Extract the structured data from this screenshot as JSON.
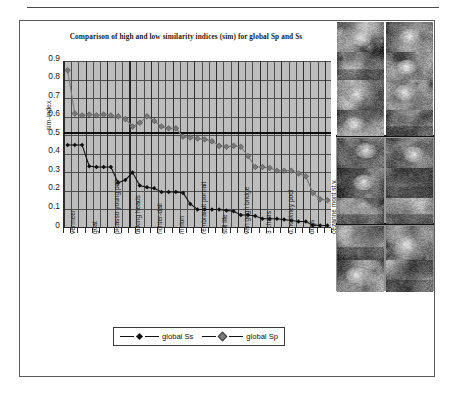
{
  "figure": {
    "title": "Comparison of high and low similarity indices (sim) for global Sp and Ss",
    "ylabel": "sim-index"
  },
  "legend": {
    "position": "bottom-center",
    "items": [
      {
        "label": "global Ss",
        "marker": "diamond",
        "color": "#111111"
      },
      {
        "label": "global Sp",
        "marker": "diamond",
        "color": "#7a7a7a"
      }
    ]
  },
  "colors": {
    "plot_background": "#bdbdbd",
    "gridline": "#4d4d4d",
    "axis": "#2b2b2b",
    "series_ss": "#111111",
    "series_sp": "#7a7a7a",
    "threshold_line": "#0d0d0d",
    "frame": "#5a5a5a"
  },
  "annotations": {
    "threshold_value": 0.515,
    "vertical_marker_category": "talking heads"
  },
  "thumbnails": {
    "columns": 2,
    "groups": [
      {
        "name": "group-portraits",
        "rows": [
          [
            {
              "name": "thumb-blonde-portrait"
            },
            {
              "name": "thumb-girl-pearl-earring"
            }
          ],
          [
            {
              "name": "thumb-landscape-field"
            },
            {
              "name": "thumb-goat"
            }
          ],
          [
            {
              "name": "thumb-two-people-standing"
            },
            {
              "name": "thumb-mother-child"
            }
          ],
          [
            {
              "name": "thumb-two-heads"
            },
            {
              "name": "thumb-abstract-faces"
            }
          ]
        ]
      },
      {
        "name": "group-paintings",
        "rows": [
          [
            {
              "name": "thumb-dark-portrait"
            },
            {
              "name": "thumb-richter-blur"
            }
          ],
          [
            {
              "name": "thumb-white-hat-woman"
            },
            {
              "name": "thumb-straw-hat-woman"
            }
          ],
          [
            {
              "name": "thumb-standing-figure"
            },
            {
              "name": "thumb-walking-figure"
            }
          ]
        ]
      },
      {
        "name": "group-scenes",
        "rows": [
          [
            {
              "name": "thumb-cattle-scene"
            },
            {
              "name": "thumb-green-foliage"
            }
          ],
          [
            {
              "name": "thumb-dark-animals"
            },
            {
              "name": "thumb-forest-scene"
            }
          ]
        ]
      }
    ]
  },
  "chart_data": {
    "type": "line",
    "title": "Comparison of high and low similarity indices (sim) for global Sp and Ss",
    "xlabel": "",
    "ylabel": "sim-index",
    "ylim": [
      0,
      0.9
    ],
    "yticks": [
      "0.9",
      "0.8",
      "0.7",
      "0.6",
      "0.5",
      "0.4",
      "0.3",
      "0.2",
      "0.1",
      "0"
    ],
    "grid": true,
    "legend_position": "bottom",
    "categories": [
      "vermeer",
      "",
      "",
      "goat",
      "",
      "",
      "picasso young pair",
      "",
      "",
      "talking heads",
      "",
      "",
      "richter-dali",
      "",
      "",
      "melon",
      "",
      "",
      "rembrandt portrait",
      "",
      "",
      "still life",
      "",
      "",
      "van gogh bridge",
      "",
      "",
      "3 chairs",
      "",
      "",
      "d.hockney pool",
      "",
      "",
      "dogs",
      "",
      "",
      "cezanne mont st.v."
    ],
    "tick_labels": [
      "vermeer",
      "goat",
      "picasso young pair",
      "talking heads",
      "richter-dali",
      "melon",
      "rembrandt portrait",
      "still life",
      "van gogh bridge",
      "3 chairs",
      "d.hockney pool",
      "dogs",
      "cezanne mont st.v."
    ],
    "series": [
      {
        "name": "global Sp",
        "color": "#7a7a7a",
        "values": [
          0.85,
          0.615,
          0.605,
          0.61,
          0.605,
          0.61,
          0.605,
          0.6,
          0.585,
          0.545,
          0.565,
          0.6,
          0.575,
          0.545,
          0.535,
          0.535,
          0.49,
          0.485,
          0.48,
          0.475,
          0.465,
          0.44,
          0.435,
          0.44,
          0.435,
          0.385,
          0.325,
          0.325,
          0.32,
          0.305,
          0.305,
          0.305,
          0.29,
          0.275,
          0.185,
          0.15,
          0.145
        ]
      },
      {
        "name": "global Ss",
        "color": "#111111",
        "values": [
          0.445,
          0.445,
          0.445,
          0.33,
          0.325,
          0.325,
          0.325,
          0.24,
          0.255,
          0.295,
          0.225,
          0.215,
          0.21,
          0.19,
          0.19,
          0.19,
          0.185,
          0.125,
          0.095,
          0.095,
          0.095,
          0.095,
          0.09,
          0.085,
          0.065,
          0.065,
          0.06,
          0.045,
          0.045,
          0.045,
          0.04,
          0.035,
          0.03,
          0.03,
          0.01,
          0.008,
          0.008
        ]
      }
    ],
    "threshold": {
      "value": 0.515,
      "style": "solid",
      "color": "#0d0d0d"
    }
  }
}
